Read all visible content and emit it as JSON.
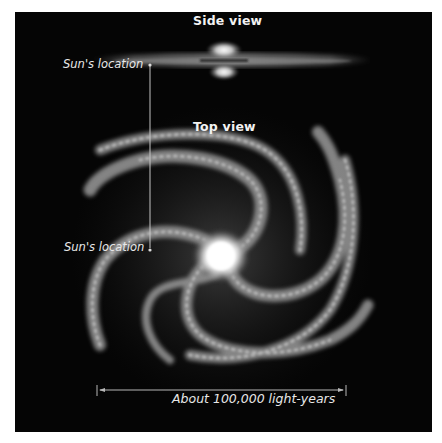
{
  "figure": {
    "side_view": {
      "title": "Side view",
      "sun_label": "Sun's location"
    },
    "top_view": {
      "title": "Top view",
      "sun_label": "Sun's location"
    },
    "scale_bar": {
      "label": "About 100,000 light-years"
    },
    "colors": {
      "background": "#050505",
      "text": "#eeeeee",
      "line": "#bdbdbd",
      "core": "#ffffff"
    }
  }
}
